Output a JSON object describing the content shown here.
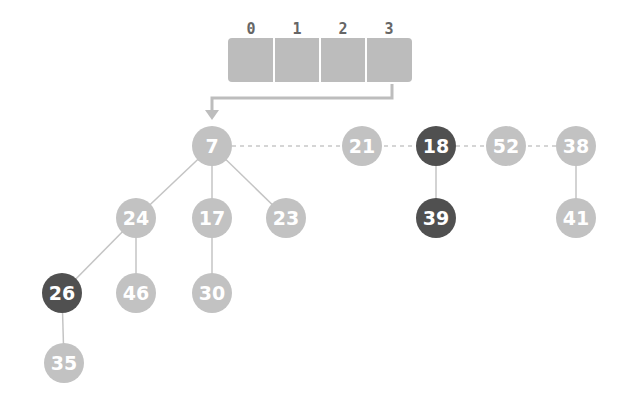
{
  "array": {
    "indices": [
      "0",
      "1",
      "2",
      "3"
    ],
    "fill_color": "#bcbcbc"
  },
  "colors": {
    "light_node": "#c2c2c2",
    "dark_node": "#505050",
    "edge": "#bdbdbd"
  },
  "nodes": [
    {
      "key": "7",
      "x": 212,
      "y": 146,
      "marked": false
    },
    {
      "key": "21",
      "x": 362,
      "y": 146,
      "marked": false
    },
    {
      "key": "18",
      "x": 436,
      "y": 146,
      "marked": true
    },
    {
      "key": "52",
      "x": 506,
      "y": 146,
      "marked": false
    },
    {
      "key": "38",
      "x": 576,
      "y": 146,
      "marked": false
    },
    {
      "key": "24",
      "x": 136,
      "y": 218,
      "marked": false
    },
    {
      "key": "17",
      "x": 212,
      "y": 218,
      "marked": false
    },
    {
      "key": "23",
      "x": 286,
      "y": 218,
      "marked": false
    },
    {
      "key": "39",
      "x": 436,
      "y": 218,
      "marked": true
    },
    {
      "key": "41",
      "x": 576,
      "y": 218,
      "marked": false
    },
    {
      "key": "26",
      "x": 62,
      "y": 293,
      "marked": true
    },
    {
      "key": "46",
      "x": 136,
      "y": 293,
      "marked": false
    },
    {
      "key": "30",
      "x": 212,
      "y": 293,
      "marked": false
    },
    {
      "key": "35",
      "x": 64,
      "y": 363,
      "marked": false
    }
  ]
}
